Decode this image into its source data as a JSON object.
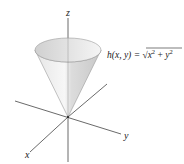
{
  "diagram": {
    "type": "3d-surface-plot",
    "surface": "cone",
    "function_label": {
      "lhs": "h(x, y) = ",
      "sqrt_symbol": "√",
      "radicand_x": "x",
      "radicand_plus": " + ",
      "radicand_y": "y",
      "exponent": "2"
    },
    "axes": {
      "x_label": "x",
      "y_label": "y",
      "z_label": "z"
    },
    "colors": {
      "axis": "#444444",
      "cone_fill_light": "#f2f2f2",
      "cone_fill_dark": "#cfcfcf",
      "cone_edge": "#9a9a9a"
    }
  }
}
